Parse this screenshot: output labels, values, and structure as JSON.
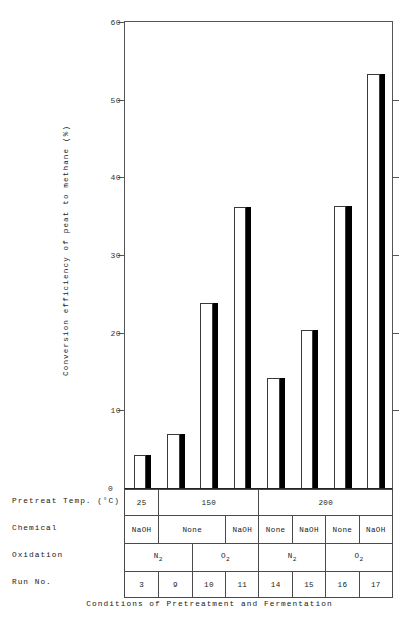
{
  "chart_data": {
    "type": "bar",
    "title": "",
    "xlabel": "Conditions of Pretreatment and Fermentation",
    "ylabel": "Conversion efficiency of peat to methane (%)",
    "ylim": [
      0,
      60
    ],
    "yticks": [
      0,
      10,
      20,
      30,
      40,
      50,
      60
    ],
    "grid": false,
    "legend": null,
    "categories": [
      "3",
      "9",
      "10",
      "11",
      "14",
      "15",
      "16",
      "17"
    ],
    "values": [
      4.3,
      7.0,
      23.8,
      36.2,
      14.2,
      20.3,
      36.3,
      53.3
    ],
    "bar_style": "open-bar-with-solid-black-shadow",
    "bars": [
      {
        "run": "3",
        "value": 4.3,
        "pretreat_temp": "25",
        "chemical": "NaOH",
        "oxidation": "N2"
      },
      {
        "run": "9",
        "value": 7.0,
        "pretreat_temp": "150",
        "chemical": "None",
        "oxidation": "N2"
      },
      {
        "run": "10",
        "value": 23.8,
        "pretreat_temp": "150",
        "chemical": "None",
        "oxidation": "O2"
      },
      {
        "run": "11",
        "value": 36.2,
        "pretreat_temp": "150",
        "chemical": "NaOH",
        "oxidation": "O2"
      },
      {
        "run": "14",
        "value": 14.2,
        "pretreat_temp": "200",
        "chemical": "None",
        "oxidation": "N2"
      },
      {
        "run": "15",
        "value": 20.3,
        "pretreat_temp": "200",
        "chemical": "NaOH",
        "oxidation": "N2"
      },
      {
        "run": "16",
        "value": 36.3,
        "pretreat_temp": "200",
        "chemical": "None",
        "oxidation": "O2"
      },
      {
        "run": "17",
        "value": 53.3,
        "pretreat_temp": "200",
        "chemical": "NaOH",
        "oxidation": "O2"
      }
    ]
  },
  "axis": {
    "y_title": "Conversion efficiency of peat to methane (%)",
    "y_ticks": [
      "60",
      "50",
      "40",
      "30",
      "20",
      "10"
    ],
    "zero_label": "0"
  },
  "table": {
    "row_labels": {
      "temp": "Pretreat Temp. (°C)",
      "chemical": "Chemical",
      "oxidation": "Oxidation",
      "run": "Run No."
    },
    "temp_cells": [
      {
        "text": "25",
        "span": 1
      },
      {
        "text": "150",
        "span": 3
      },
      {
        "text": "200",
        "span": 4
      }
    ],
    "chemical_cells": [
      {
        "text": "NaOH",
        "span": 1
      },
      {
        "text": "None",
        "span": 2
      },
      {
        "text": "NaOH",
        "span": 1
      },
      {
        "text": "None",
        "span": 1
      },
      {
        "text": "NaOH",
        "span": 1
      },
      {
        "text": "None",
        "span": 1
      },
      {
        "text": "NaOH",
        "span": 1
      }
    ],
    "oxidation_cells": [
      {
        "base": "N",
        "sub": "2",
        "span": 2
      },
      {
        "base": "O",
        "sub": "2",
        "span": 2
      },
      {
        "base": "N",
        "sub": "2",
        "span": 2
      },
      {
        "base": "O",
        "sub": "2",
        "span": 2
      }
    ],
    "run_cells": [
      "3",
      "9",
      "10",
      "11",
      "14",
      "15",
      "16",
      "17"
    ]
  },
  "caption": "Conditions of Pretreatment and Fermentation",
  "colors": {
    "bar_fill_open": "#ffffff",
    "bar_fill_solid": "#000000",
    "bar_outline": "#3a3a3a",
    "axis": "#555555",
    "text": "#1a1a1a",
    "background": "#ffffff"
  }
}
